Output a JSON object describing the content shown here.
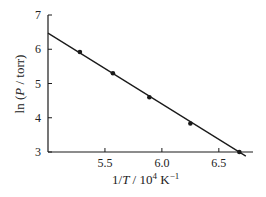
{
  "chart_data": {
    "type": "scatter",
    "title": "",
    "xlabel": "1/T / 10^4 K^-1",
    "ylabel": "ln (P / torr)",
    "xlim": [
      5.0,
      6.8
    ],
    "ylim": [
      3,
      7
    ],
    "x_ticks": [
      5.5,
      6.0,
      6.5
    ],
    "x_tick_labels": [
      "5.5",
      "6.0",
      "6.5"
    ],
    "y_ticks": [
      3,
      4,
      5,
      6,
      7
    ],
    "y_tick_labels": [
      "3",
      "4",
      "5",
      "6",
      "7"
    ],
    "grid": false,
    "legend": null,
    "series": [
      {
        "name": "data",
        "type": "scatter",
        "x": [
          5.28,
          5.57,
          5.89,
          6.25,
          6.68
        ],
        "y": [
          5.92,
          5.3,
          4.6,
          3.83,
          3.0
        ]
      },
      {
        "name": "fit",
        "type": "line",
        "x": [
          5.0,
          6.8
        ],
        "y": [
          6.47,
          2.75
        ]
      }
    ]
  },
  "labels": {
    "xlabel_main": "1/",
    "xlabel_T": "T",
    "xlabel_units": " / 10",
    "xlabel_exp": "4",
    "xlabel_K": " K",
    "xlabel_kexp": "−1",
    "ylabel_ln": "ln (",
    "ylabel_P": "P",
    "ylabel_rest": " / torr)"
  },
  "colors": {
    "ink": "#1a1a1a",
    "background": "#ffffff"
  }
}
